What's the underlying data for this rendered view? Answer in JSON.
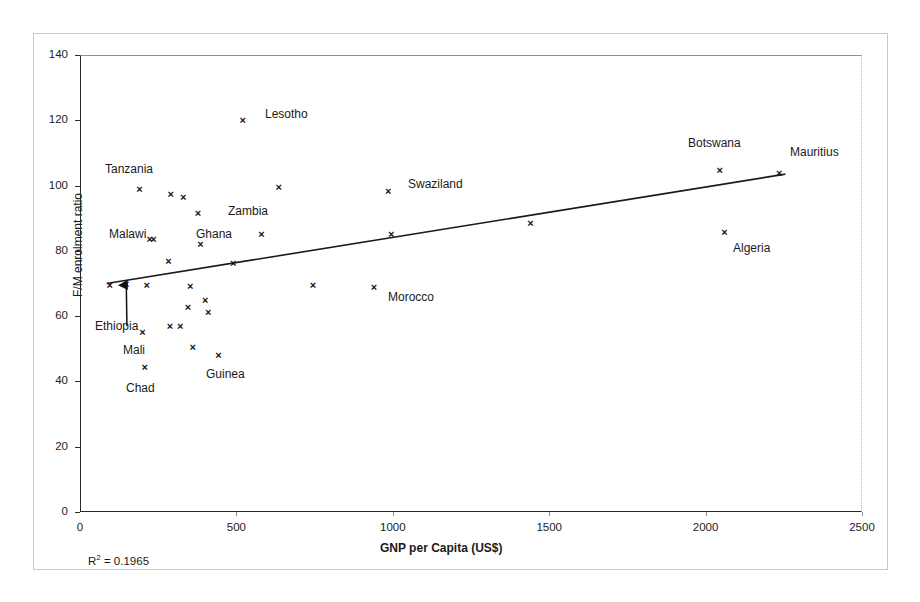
{
  "chart_data": {
    "type": "scatter",
    "title": "",
    "xlabel": "GNP per Capita (US$)",
    "ylabel": "F/M enrolment ratio",
    "xlim": [
      0,
      2500
    ],
    "ylim": [
      0,
      140
    ],
    "xticks": [
      0,
      500,
      1000,
      1500,
      2000,
      2500
    ],
    "yticks": [
      0,
      20,
      40,
      60,
      80,
      100,
      120,
      140
    ],
    "grid": false,
    "legend": null,
    "annotations": [
      {
        "name": "r-squared",
        "text": "R2 = 0.1965",
        "display": "R² = 0.1965"
      }
    ],
    "trendline": {
      "type": "linear",
      "x_start": 85,
      "y_start": 70.0,
      "x_end": 2255,
      "y_end": 103.5,
      "r_squared": 0.1965
    },
    "callout_arrow": {
      "points_to": "Ethiopia",
      "from_label_x": 150,
      "from_label_y": 57,
      "to_x": 148,
      "to_y": 69.5
    },
    "points": [
      {
        "label": "Ethiopia",
        "x": 148,
        "y": 69.8,
        "labelled": true
      },
      {
        "label": "",
        "x": 95,
        "y": 69.3,
        "labelled": false
      },
      {
        "label": "Tanzania",
        "x": 190,
        "y": 98.8,
        "labelled": true
      },
      {
        "label": "Malawi",
        "x": 223,
        "y": 83.6,
        "labelled": true
      },
      {
        "label": "",
        "x": 235,
        "y": 83.6,
        "labelled": false
      },
      {
        "label": "",
        "x": 213,
        "y": 69.5,
        "labelled": false
      },
      {
        "label": "",
        "x": 200,
        "y": 55.0,
        "labelled": false
      },
      {
        "label": "Chad",
        "x": 207,
        "y": 44.3,
        "labelled": true
      },
      {
        "label": "",
        "x": 290,
        "y": 97.3,
        "labelled": false
      },
      {
        "label": "",
        "x": 283,
        "y": 76.8,
        "labelled": false
      },
      {
        "label": "",
        "x": 288,
        "y": 56.8,
        "labelled": false
      },
      {
        "label": "",
        "x": 320,
        "y": 56.8,
        "labelled": false
      },
      {
        "label": "",
        "x": 330,
        "y": 96.3,
        "labelled": false
      },
      {
        "label": "",
        "x": 352,
        "y": 69.0,
        "labelled": false
      },
      {
        "label": "",
        "x": 345,
        "y": 62.5,
        "labelled": false
      },
      {
        "label": "",
        "x": 360,
        "y": 50.3,
        "labelled": false
      },
      {
        "label": "Zambia",
        "x": 377,
        "y": 91.3,
        "labelled": true
      },
      {
        "label": "Ghana",
        "x": 385,
        "y": 82.0,
        "labelled": true
      },
      {
        "label": "",
        "x": 400,
        "y": 64.8,
        "labelled": false
      },
      {
        "label": "",
        "x": 410,
        "y": 61.0,
        "labelled": false
      },
      {
        "label": "Guinea",
        "x": 443,
        "y": 48.0,
        "labelled": false
      },
      {
        "label": "Lesotho",
        "x": 520,
        "y": 120.0,
        "labelled": true
      },
      {
        "label": "",
        "x": 490,
        "y": 76.0,
        "labelled": false
      },
      {
        "label": "",
        "x": 580,
        "y": 85.0,
        "labelled": false
      },
      {
        "label": "",
        "x": 635,
        "y": 99.5,
        "labelled": false
      },
      {
        "label": "",
        "x": 745,
        "y": 69.5,
        "labelled": false
      },
      {
        "label": "Morocco",
        "x": 940,
        "y": 68.8,
        "labelled": true
      },
      {
        "label": "Swaziland",
        "x": 985,
        "y": 98.3,
        "labelled": true
      },
      {
        "label": "",
        "x": 995,
        "y": 85.0,
        "labelled": false
      },
      {
        "label": "",
        "x": 1440,
        "y": 88.5,
        "labelled": false
      },
      {
        "label": "Botswana",
        "x": 2045,
        "y": 104.5,
        "labelled": true
      },
      {
        "label": "Algeria",
        "x": 2060,
        "y": 85.5,
        "labelled": true
      },
      {
        "label": "Mauritius",
        "x": 2235,
        "y": 103.8,
        "labelled": true
      }
    ],
    "text_labels": [
      {
        "name": "label-tanzania",
        "text": "Tanzania",
        "x": 105,
        "y": 163
      },
      {
        "name": "label-malawi",
        "text": "Malawi",
        "x": 109,
        "y": 228
      },
      {
        "name": "label-ethiopia",
        "text": "Ethiopia",
        "x": 95,
        "y": 320
      },
      {
        "name": "label-mali",
        "text": "Mali",
        "x": 123,
        "y": 344
      },
      {
        "name": "label-chad",
        "text": "Chad",
        "x": 126,
        "y": 382
      },
      {
        "name": "label-ghana",
        "text": "Ghana",
        "x": 196,
        "y": 228
      },
      {
        "name": "label-zambia",
        "text": "Zambia",
        "x": 228,
        "y": 205
      },
      {
        "name": "label-guinea",
        "text": "Guinea",
        "x": 206,
        "y": 368
      },
      {
        "name": "label-lesotho",
        "text": "Lesotho",
        "x": 265,
        "y": 108
      },
      {
        "name": "label-morocco",
        "text": "Morocco",
        "x": 388,
        "y": 291
      },
      {
        "name": "label-swaziland",
        "text": "Swaziland",
        "x": 408,
        "y": 178
      },
      {
        "name": "label-botswana",
        "text": "Botswana",
        "x": 688,
        "y": 137
      },
      {
        "name": "label-mauritius",
        "text": "Mauritius",
        "x": 790,
        "y": 146
      },
      {
        "name": "label-algeria",
        "text": "Algeria",
        "x": 733,
        "y": 242
      }
    ]
  },
  "marker_glyph": "×"
}
